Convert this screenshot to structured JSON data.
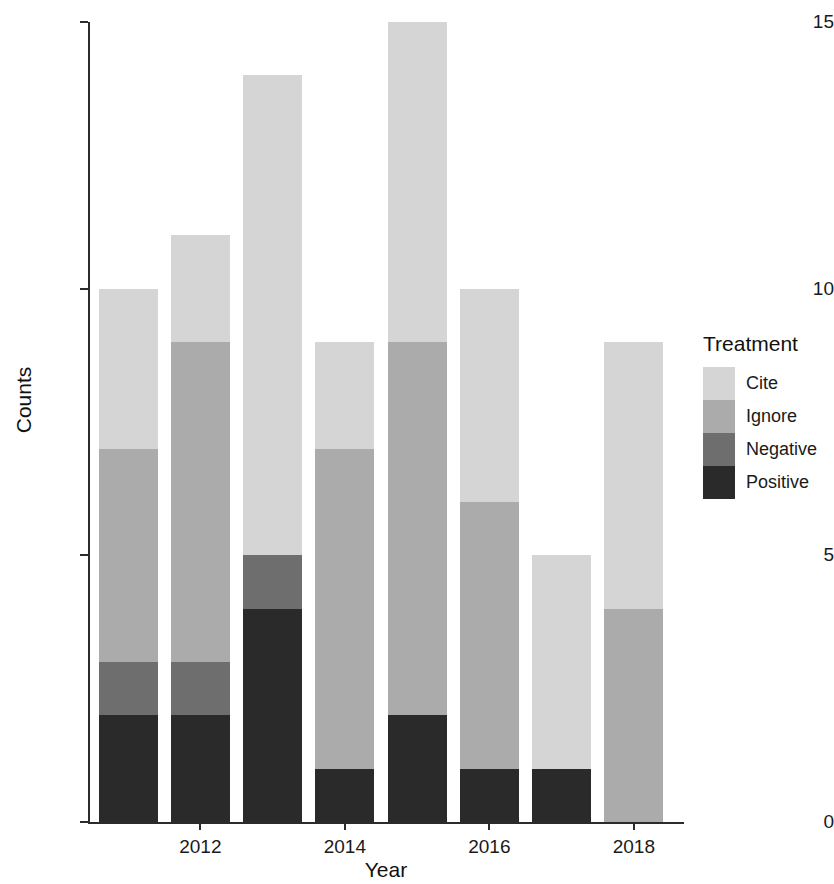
{
  "chart_data": {
    "type": "bar",
    "barmode": "stacked",
    "title": "",
    "xlabel": "Year",
    "ylabel": "Counts",
    "categories": [
      "2011",
      "2012",
      "2013",
      "2014",
      "2015",
      "2016",
      "2017",
      "2018"
    ],
    "x_tick_labels": [
      "2012",
      "2014",
      "2016",
      "2018"
    ],
    "y_tick_labels": [
      "0",
      "5",
      "10",
      "15"
    ],
    "ylim": [
      0,
      15
    ],
    "y_ticks": [
      0,
      5,
      10,
      15
    ],
    "grid": false,
    "legend_title": "Treatment",
    "legend_position": "right",
    "series": [
      {
        "name": "Cite",
        "color": "#d5d5d5",
        "values": [
          3,
          2,
          9,
          2,
          6,
          4,
          4,
          5
        ]
      },
      {
        "name": "Ignore",
        "color": "#ababab",
        "values": [
          4,
          6,
          0,
          6,
          7,
          5,
          0,
          4
        ]
      },
      {
        "name": "Negative",
        "color": "#6e6e6e",
        "values": [
          1,
          1,
          1,
          0,
          0,
          0,
          0,
          0
        ]
      },
      {
        "name": "Positive",
        "color": "#2a2a2a",
        "values": [
          2,
          2,
          4,
          1,
          2,
          1,
          1,
          0
        ]
      }
    ],
    "totals": [
      10,
      11,
      14,
      9,
      15,
      10,
      5,
      9
    ]
  },
  "legend": {
    "title": "Treatment",
    "items": [
      {
        "label": "Cite",
        "color": "#d5d5d5"
      },
      {
        "label": "Ignore",
        "color": "#ababab"
      },
      {
        "label": "Negative",
        "color": "#6e6e6e"
      },
      {
        "label": "Positive",
        "color": "#2a2a2a"
      }
    ]
  },
  "axes": {
    "y_title": "Counts",
    "x_title": "Year"
  }
}
